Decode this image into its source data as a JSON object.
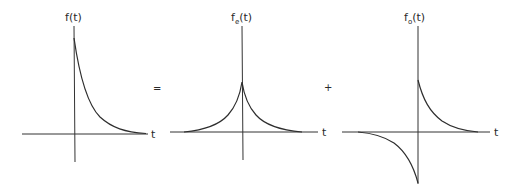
{
  "figure": {
    "operators": {
      "equals": "=",
      "plus": "+"
    },
    "panels": [
      {
        "id": "original",
        "label": "f(t)",
        "label_main": "f",
        "label_sub": "",
        "label_arg": "(t)",
        "axis_label": "t",
        "curve": "one-sided decaying exponential for t > 0, jump at t = 0"
      },
      {
        "id": "even",
        "label": "fe(t)",
        "label_main": "f",
        "label_sub": "e",
        "label_arg": "(t)",
        "axis_label": "t",
        "curve": "two-sided symmetric decaying exponential, peak at t = 0 (half height)"
      },
      {
        "id": "odd",
        "label": "fo(t)",
        "label_main": "f",
        "label_sub": "o",
        "label_arg": "(t)",
        "axis_label": "t",
        "curve": "antisymmetric: positive decaying exponential for t > 0, negative mirrored for t < 0 (half height)"
      }
    ],
    "colors": {
      "line": "#2e2e2e",
      "axis": "#333333",
      "background": "#ffffff"
    }
  }
}
